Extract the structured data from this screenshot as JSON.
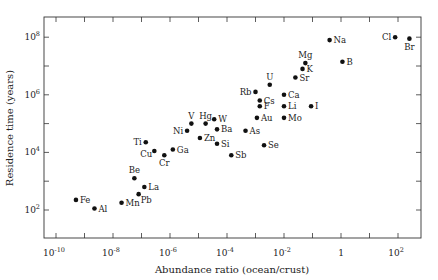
{
  "chart_data": {
    "type": "scatter",
    "title": "",
    "xlabel": "Abundance ratio (ocean/crust)",
    "ylabel": "Residence time (years)",
    "xscale": "log",
    "yscale": "log",
    "xlim_exp": [
      -10.4,
      2.8
    ],
    "ylim_exp": [
      1.1,
      8.7
    ],
    "grid": false,
    "legend": null,
    "x_ticks": [
      {
        "exp": -10,
        "label": "10",
        "sup": "-10"
      },
      {
        "exp": -8,
        "label": "10",
        "sup": "-8"
      },
      {
        "exp": -6,
        "label": "10",
        "sup": "-6"
      },
      {
        "exp": -4,
        "label": "10",
        "sup": "-4"
      },
      {
        "exp": -2,
        "label": "10",
        "sup": "-2"
      },
      {
        "exp": 0,
        "label": "1",
        "sup": ""
      },
      {
        "exp": 2,
        "label": "10",
        "sup": "2"
      }
    ],
    "y_ticks": [
      {
        "exp": 2,
        "label": "10",
        "sup": "2"
      },
      {
        "exp": 4,
        "label": "10",
        "sup": "4"
      },
      {
        "exp": 6,
        "label": "10",
        "sup": "6"
      },
      {
        "exp": 8,
        "label": "10",
        "sup": "8"
      }
    ],
    "points": [
      {
        "label": "Fe",
        "log_x": -9.3,
        "log_y": 2.35,
        "pos": "right"
      },
      {
        "label": "Al",
        "log_x": -8.65,
        "log_y": 2.05,
        "pos": "right"
      },
      {
        "label": "Mn",
        "log_x": -7.7,
        "log_y": 2.25,
        "pos": "right"
      },
      {
        "label": "Be",
        "log_x": -7.25,
        "log_y": 3.1,
        "pos": "above"
      },
      {
        "label": "Pb",
        "log_x": -7.1,
        "log_y": 2.55,
        "pos": "below-right"
      },
      {
        "label": "La",
        "log_x": -6.9,
        "log_y": 2.8,
        "pos": "right"
      },
      {
        "label": "Ti",
        "log_x": -6.85,
        "log_y": 4.35,
        "pos": "left"
      },
      {
        "label": "Cu",
        "log_x": -6.55,
        "log_y": 4.05,
        "pos": "below-left"
      },
      {
        "label": "Cr",
        "log_x": -6.2,
        "log_y": 3.9,
        "pos": "below"
      },
      {
        "label": "Ga",
        "log_x": -5.9,
        "log_y": 4.1,
        "pos": "right"
      },
      {
        "label": "Ni",
        "log_x": -5.4,
        "log_y": 4.75,
        "pos": "left"
      },
      {
        "label": "V",
        "log_x": -5.25,
        "log_y": 5.0,
        "pos": "above"
      },
      {
        "label": "Hg",
        "log_x": -4.75,
        "log_y": 5.0,
        "pos": "above"
      },
      {
        "label": "W",
        "log_x": -4.45,
        "log_y": 5.15,
        "pos": "right"
      },
      {
        "label": "Ba",
        "log_x": -4.35,
        "log_y": 4.8,
        "pos": "right"
      },
      {
        "label": "Zn",
        "log_x": -4.95,
        "log_y": 4.5,
        "pos": "right"
      },
      {
        "label": "Si",
        "log_x": -4.35,
        "log_y": 4.3,
        "pos": "right"
      },
      {
        "label": "Sb",
        "log_x": -3.85,
        "log_y": 3.9,
        "pos": "right"
      },
      {
        "label": "As",
        "log_x": -3.35,
        "log_y": 4.75,
        "pos": "right"
      },
      {
        "label": "Au",
        "log_x": -2.95,
        "log_y": 5.2,
        "pos": "right"
      },
      {
        "label": "Se",
        "log_x": -2.7,
        "log_y": 4.25,
        "pos": "right"
      },
      {
        "label": "F",
        "log_x": -2.85,
        "log_y": 5.6,
        "pos": "right"
      },
      {
        "label": "Cs",
        "log_x": -2.85,
        "log_y": 5.8,
        "pos": "right"
      },
      {
        "label": "Rb",
        "log_x": -3.0,
        "log_y": 6.1,
        "pos": "left"
      },
      {
        "label": "U",
        "log_x": -2.5,
        "log_y": 6.35,
        "pos": "above"
      },
      {
        "label": "Ca",
        "log_x": -2.0,
        "log_y": 6.0,
        "pos": "right"
      },
      {
        "label": "Li",
        "log_x": -2.0,
        "log_y": 5.6,
        "pos": "right"
      },
      {
        "label": "Mo",
        "log_x": -2.0,
        "log_y": 5.2,
        "pos": "right"
      },
      {
        "label": "I",
        "log_x": -1.05,
        "log_y": 5.6,
        "pos": "right"
      },
      {
        "label": "Sr",
        "log_x": -1.6,
        "log_y": 6.6,
        "pos": "right"
      },
      {
        "label": "K",
        "log_x": -1.35,
        "log_y": 6.9,
        "pos": "right"
      },
      {
        "label": "Mg",
        "log_x": -1.25,
        "log_y": 7.1,
        "pos": "above"
      },
      {
        "label": "Na",
        "log_x": -0.4,
        "log_y": 7.9,
        "pos": "right"
      },
      {
        "label": "B",
        "log_x": 0.05,
        "log_y": 7.15,
        "pos": "right"
      },
      {
        "label": "Cl",
        "log_x": 1.9,
        "log_y": 8.0,
        "pos": "left"
      },
      {
        "label": "Br",
        "log_x": 2.4,
        "log_y": 7.95,
        "pos": "below"
      }
    ]
  }
}
